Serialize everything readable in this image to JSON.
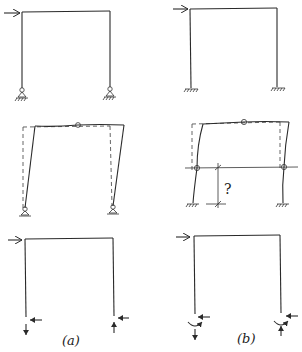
{
  "figure": {
    "columns": [
      {
        "id": "a",
        "label": "(a)",
        "support_type": "pinned"
      },
      {
        "id": "b",
        "label": "(b)",
        "support_type": "fixed"
      }
    ],
    "rows": [
      {
        "id": "loaded-frame",
        "description": "portal frame with horizontal load at top-left"
      },
      {
        "id": "deflected-shape",
        "description": "deflected shape with inflection points (hinges)"
      },
      {
        "id": "support-reactions",
        "description": "free body with support reactions"
      }
    ],
    "annotations": {
      "inflection_height_query": "?"
    },
    "colors": {
      "line": "#2a2a2a",
      "background": "#ffffff"
    }
  }
}
